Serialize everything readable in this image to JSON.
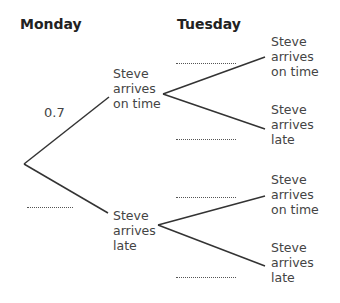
{
  "headers": {
    "day1": "Monday",
    "day2": "Tuesday"
  },
  "monday": {
    "branches": [
      {
        "outcome": "Steve arrives on time",
        "lines": [
          "Steve",
          "arrives",
          "on time"
        ],
        "probability": "0.7"
      },
      {
        "outcome": "Steve arrives late",
        "lines": [
          "Steve",
          "arrives",
          "late"
        ],
        "probability": ""
      }
    ]
  },
  "tuesday": {
    "given_on_time": [
      {
        "outcome": "Steve arrives on time",
        "lines": [
          "Steve",
          "arrives",
          "on time"
        ],
        "probability": ""
      },
      {
        "outcome": "Steve arrives late",
        "lines": [
          "Steve",
          "arrives",
          "late"
        ],
        "probability": ""
      }
    ],
    "given_late": [
      {
        "outcome": "Steve arrives on time",
        "lines": [
          "Steve",
          "arrives",
          "on time"
        ],
        "probability": ""
      },
      {
        "outcome": "Steve arrives late",
        "lines": [
          "Steve",
          "arrives",
          "late"
        ],
        "probability": ""
      }
    ]
  },
  "line_color": "#333333"
}
